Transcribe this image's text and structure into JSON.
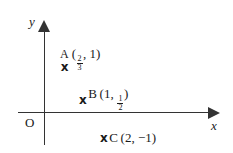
{
  "figure": {
    "type": "cartesian-point-plot",
    "background_color": "#ffffff",
    "ink_color": "#333333",
    "axes": {
      "x_label": "x",
      "y_label": "y",
      "origin_label": "O",
      "x_arrow_direction": "right",
      "y_arrow_direction": "up",
      "ticks_shown": false,
      "gridlines_shown": false
    },
    "points": [
      {
        "name": "A",
        "marker": "x",
        "label": "A",
        "open_paren": "(",
        "x_numerator": "2",
        "x_denominator": "3",
        "separator": ", ",
        "y_value": "1",
        "close_paren": ")",
        "coordinate_text": "(2/3, 1)"
      },
      {
        "name": "B",
        "marker": "x",
        "label": "B",
        "open_paren": "(",
        "x_value": "1",
        "separator": ", ",
        "y_numerator": "1",
        "y_denominator": "2",
        "close_paren": ")",
        "coordinate_text": "(1, 1/2)"
      },
      {
        "name": "C",
        "marker": "x",
        "label": "C",
        "open_paren": "(",
        "x_value": "2",
        "separator": ", ",
        "y_value": "−1",
        "close_paren": ")",
        "coordinate_text": "(2, −1)"
      }
    ]
  }
}
